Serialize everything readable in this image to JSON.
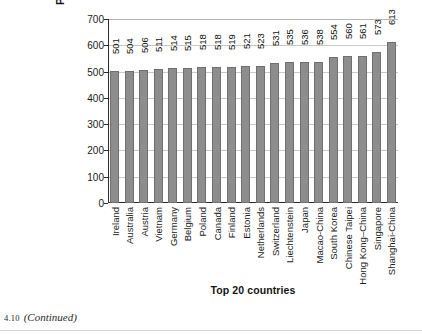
{
  "chart_data": {
    "type": "bar",
    "title": "",
    "xlabel": "Top 20 countries",
    "ylabel": "PISA score (math)",
    "ylim": [
      0,
      700
    ],
    "yticks": [
      0,
      100,
      200,
      300,
      400,
      500,
      600,
      700
    ],
    "grid": true,
    "legend": null,
    "orientation": "vertical",
    "bar_color": "#8d8d8d",
    "bar_edge_color": "#6f6f6f",
    "data_labels_rotated": true,
    "categories": [
      "Ireland",
      "Australia",
      "Austria",
      "Vietnam",
      "Germany",
      "Belgium",
      "Poland",
      "Canada",
      "Finland",
      "Estonia",
      "Netherlands",
      "Switzerland",
      "Liechtenstein",
      "Japan",
      "Macao-China",
      "South Korea",
      "Chinese Taipei",
      "Hong Kong–China",
      "Singapore",
      "Shanghai-China"
    ],
    "values": [
      501,
      504,
      506,
      511,
      514,
      515,
      518,
      518,
      519,
      521,
      523,
      531,
      535,
      536,
      538,
      554,
      560,
      561,
      573,
      613
    ]
  },
  "caption": {
    "number": "4.10",
    "text": "(Continued)"
  }
}
